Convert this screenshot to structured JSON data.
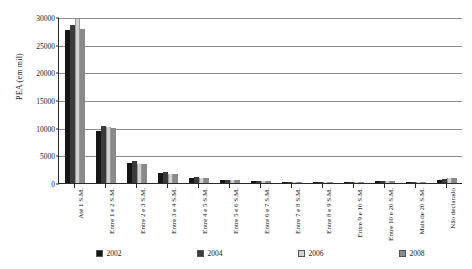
{
  "chart_data": {
    "type": "bar",
    "title": "",
    "xlabel": "",
    "ylabel": "PEA (em mil)",
    "ylim": [
      0,
      30000
    ],
    "ytick_labels": [
      "0",
      "5000",
      "10000",
      "15000",
      "20000",
      "25000",
      "30000"
    ],
    "ytick_values": [
      0,
      5000,
      10000,
      15000,
      20000,
      25000,
      30000
    ],
    "grid": true,
    "legend_position": "bottom",
    "categories": [
      "Até 1 S.M.",
      "Entre 1 e 2 S.M.",
      "Entre 2 e 3 S.M.",
      "Entre 3 e 4 S.M.",
      "Entre 4 e 5 S.M.",
      "Entre 5 e 6 S.M.",
      "Entre 6 e 7 S.M.",
      "Entre 7 e 8 S.M.",
      "Entre 8 e 9 S.M.",
      "Entre 9 e 10 S.M.",
      "Entre 10 e 20 S.M.",
      "Mais de 20 S.M.",
      "Não declarado"
    ],
    "series": [
      {
        "name": "2002",
        "color": "#151515",
        "values": [
          27600,
          9400,
          3600,
          1800,
          900,
          500,
          300,
          220,
          150,
          120,
          330,
          120,
          620
        ]
      },
      {
        "name": "2004",
        "color": "#3b3b3b",
        "values": [
          28600,
          10300,
          3900,
          2000,
          1000,
          560,
          330,
          240,
          170,
          130,
          360,
          130,
          700
        ]
      },
      {
        "name": "2006",
        "color": "#d2d2d2",
        "values": [
          29600,
          10200,
          3400,
          1650,
          820,
          470,
          280,
          200,
          140,
          110,
          300,
          110,
          820
        ]
      },
      {
        "name": "2008",
        "color": "#8a8a8a",
        "values": [
          27800,
          9900,
          3500,
          1700,
          860,
          490,
          290,
          210,
          145,
          115,
          310,
          115,
          900
        ]
      }
    ]
  }
}
